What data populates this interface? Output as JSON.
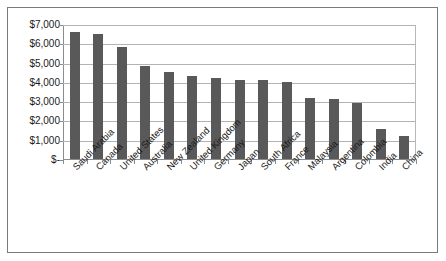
{
  "chart_data": {
    "type": "bar",
    "title": "",
    "subtitle": "",
    "xlabel": "",
    "ylabel": "",
    "categories": [
      "Saudi Arabia",
      "Canada",
      "United States",
      "Australia",
      "New Zealand",
      "United Kingdom",
      "Germany",
      "Japan",
      "South Africa",
      "France",
      "Malaysia",
      "Argentina",
      "Colombia",
      "India",
      "China"
    ],
    "values": [
      6600,
      6500,
      5800,
      4800,
      4500,
      4300,
      4200,
      4100,
      4100,
      4000,
      3150,
      3100,
      2900,
      1550,
      1200
    ],
    "ylim": [
      0,
      7000
    ],
    "ytick_values": [
      0,
      1000,
      2000,
      3000,
      4000,
      5000,
      6000,
      7000
    ],
    "ytick_labels": [
      "$-",
      "$1,000",
      "$2,000",
      "$3,000",
      "$4,000",
      "$5,000",
      "$6,000",
      "$7,000"
    ],
    "grid": true,
    "legend": false,
    "legend_position": "none",
    "series_color": "#595959",
    "gridline_color": "#b3b3b3",
    "axis_color": "#8c8c8c",
    "frame_border_color": "#7b7b7b",
    "background_color": "#ffffff",
    "bar_count": 15,
    "value_labels_shown": false
  }
}
